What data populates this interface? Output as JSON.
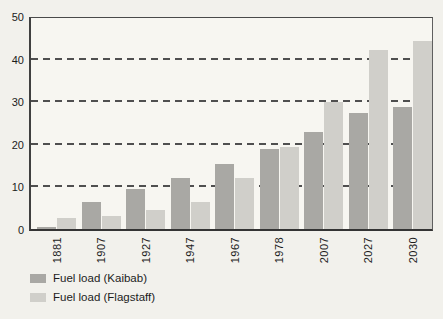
{
  "chart_data": {
    "type": "bar",
    "title": "",
    "xlabel": "",
    "ylabel": "",
    "categories": [
      "1881",
      "1907",
      "1927",
      "1947",
      "1967",
      "1978",
      "2007",
      "2027",
      "2030"
    ],
    "series": [
      {
        "name": "Fuel load (Kaibab)",
        "color": "#a9a8a4",
        "values": [
          0.5,
          6.5,
          9.5,
          12,
          15.5,
          19,
          23,
          27.5,
          29
        ]
      },
      {
        "name": "Fuel load (Flagstaff)",
        "color": "#d0cfca",
        "values": [
          2.5,
          3,
          4.5,
          6.5,
          12,
          19.5,
          30,
          42.5,
          44.5
        ]
      }
    ],
    "ylim": [
      0,
      50
    ],
    "yticks": [
      0,
      10,
      20,
      30,
      40,
      50
    ],
    "grid": "horizontal-dashed",
    "legend_position": "bottom-left",
    "x_tick_rotation": -90
  },
  "colors": {
    "page_bg": "#f2f1ec",
    "plot_bg": "#f7f6f1",
    "axis": "#404040",
    "gridline": "#4f4f4f",
    "text": "#1c1c1c"
  }
}
